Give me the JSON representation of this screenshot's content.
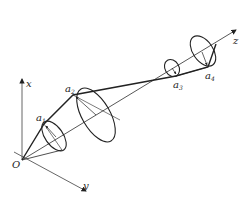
{
  "diagram": {
    "type": "3d-kinematic-chain",
    "stroke_color": "#222222",
    "axes": {
      "origin": {
        "label": "O",
        "x": 22,
        "y": 160
      },
      "x": {
        "label": "x",
        "end": {
          "x": 22,
          "y": 78
        }
      },
      "y": {
        "label": "y",
        "end": {
          "x": 87,
          "y": 192
        }
      },
      "z": {
        "label": "z",
        "end": {
          "x": 237,
          "y": 29
        }
      }
    },
    "joints": [
      {
        "label": "a",
        "sub": "1",
        "x": 44,
        "y": 124
      },
      {
        "label": "a",
        "sub": "2",
        "x": 73,
        "y": 95
      },
      {
        "label": "a",
        "sub": "3",
        "x": 176,
        "y": 76
      },
      {
        "label": "a",
        "sub": "4",
        "x": 208,
        "y": 67
      }
    ],
    "apex": {
      "x": 216,
      "y": 44
    }
  }
}
